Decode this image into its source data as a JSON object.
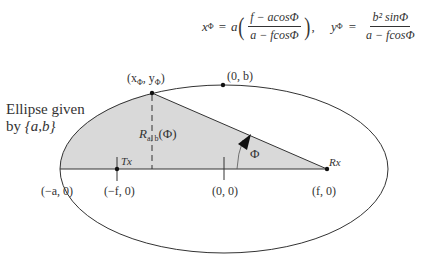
{
  "equations": {
    "x_phi": {
      "lhs": "x",
      "lhs_sub": "Φ",
      "equals": "=",
      "coef": "a",
      "numerator": "f − acosΦ",
      "denominator": "a − fcosΦ",
      "trailing": ","
    },
    "y_phi": {
      "lhs": "y",
      "lhs_sub": "Φ",
      "equals": "=",
      "numerator": "b² sinΦ",
      "denominator": "a − fcosΦ"
    }
  },
  "labels": {
    "ellipse_title_line1": "Ellipse given",
    "ellipse_title_line2_prefix": "by ",
    "ellipse_title_line2_param": "{a,b}",
    "point_phi": "(x",
    "point_phi_sub1": "Φ",
    "point_phi_mid": ", y",
    "point_phi_sub2": "Φ",
    "point_phi_end": ")",
    "zero_b": "(0, b)",
    "radius_R": "R",
    "radius_sub": "a, b",
    "radius_arg": "(Φ)",
    "angle": "Φ",
    "tx": "Tx",
    "rx": "Rx",
    "neg_a": "(−a, 0)",
    "neg_f": "(−f, 0)",
    "origin": "(0, 0)",
    "pos_f": "(f, 0)"
  },
  "colors": {
    "stroke": "#333333",
    "fill": "#d9d9d9",
    "background": "#ffffff"
  }
}
